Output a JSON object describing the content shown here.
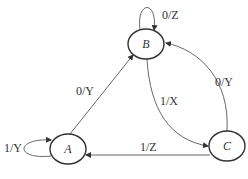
{
  "diagram": {
    "type": "state-diagram",
    "states": [
      {
        "id": "A",
        "label": "A"
      },
      {
        "id": "B",
        "label": "B"
      },
      {
        "id": "C",
        "label": "C"
      }
    ],
    "transitions": [
      {
        "from": "A",
        "to": "A",
        "label": "1/Y"
      },
      {
        "from": "A",
        "to": "B",
        "label": "0/Y"
      },
      {
        "from": "B",
        "to": "B",
        "label": "0/Z"
      },
      {
        "from": "B",
        "to": "C",
        "label": "1/X"
      },
      {
        "from": "C",
        "to": "B",
        "label": "0/Y"
      },
      {
        "from": "C",
        "to": "A",
        "label": "1/Z"
      }
    ]
  }
}
